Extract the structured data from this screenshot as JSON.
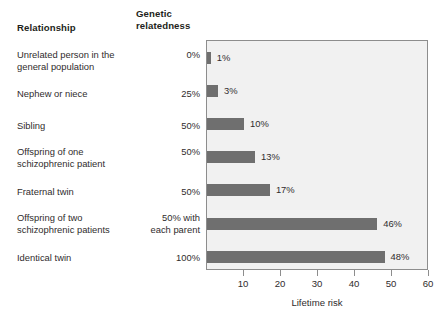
{
  "headers": {
    "relationship": "Relationship",
    "relatedness_line1": "Genetic",
    "relatedness_line2": "relatedness"
  },
  "colors": {
    "bar": "#6f6f6f",
    "plot_background": "#f1f1f1",
    "plot_border": "#8d8d8d",
    "text": "#302c2d"
  },
  "chart_data": {
    "type": "bar",
    "orientation": "horizontal",
    "title": "",
    "xlabel": "Lifetime risk",
    "ylabel": "",
    "xlim": [
      0,
      60
    ],
    "xticks": [
      10,
      20,
      30,
      40,
      50,
      60
    ],
    "grid": false,
    "legend": "none",
    "categories": [
      "Unrelated person in the general population",
      "Nephew or niece",
      "Sibling",
      "Offspring of one schizophrenic patient",
      "Fraternal twin",
      "Offspring of two schizophrenic patients",
      "Identical twin"
    ],
    "values": [
      1,
      3,
      10,
      13,
      17,
      46,
      48
    ],
    "value_labels": [
      "1%",
      "3%",
      "10%",
      "13%",
      "17%",
      "46%",
      "48%"
    ],
    "genetic_relatedness": [
      "0%",
      "25%",
      "50%",
      "50%",
      "50%",
      "50% with each parent",
      "100%"
    ]
  },
  "rows": [
    {
      "label_line1": "Unrelated person in the",
      "label_line2": "general population",
      "relatedness_line1": "0%",
      "relatedness_line2": "",
      "value": 1,
      "value_label": "1%"
    },
    {
      "label_line1": "Nephew or niece",
      "label_line2": "",
      "relatedness_line1": "25%",
      "relatedness_line2": "",
      "value": 3,
      "value_label": "3%"
    },
    {
      "label_line1": "Sibling",
      "label_line2": "",
      "relatedness_line1": "50%",
      "relatedness_line2": "",
      "value": 10,
      "value_label": "10%"
    },
    {
      "label_line1": "Offspring of one",
      "label_line2": "schizophrenic patient",
      "relatedness_line1": "50%",
      "relatedness_line2": "",
      "value": 13,
      "value_label": "13%"
    },
    {
      "label_line1": "Fraternal twin",
      "label_line2": "",
      "relatedness_line1": "50%",
      "relatedness_line2": "",
      "value": 17,
      "value_label": "17%"
    },
    {
      "label_line1": "Offspring of two",
      "label_line2": "schizophrenic patients",
      "relatedness_line1": "50% with",
      "relatedness_line2": "each parent",
      "value": 46,
      "value_label": "46%"
    },
    {
      "label_line1": "Identical twin",
      "label_line2": "",
      "relatedness_line1": "100%",
      "relatedness_line2": "",
      "value": 48,
      "value_label": "48%"
    }
  ],
  "axis": {
    "title": "Lifetime risk",
    "ticks": [
      "10",
      "20",
      "30",
      "40",
      "50",
      "60"
    ]
  }
}
